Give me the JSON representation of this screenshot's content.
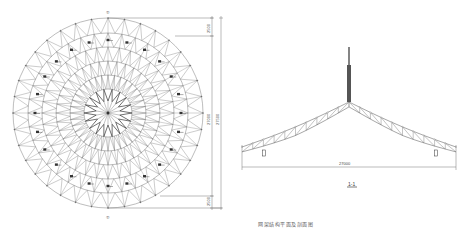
{
  "plan_view": {
    "axis_top_label": "①",
    "axis_bottom_label": "①",
    "dim_top": "2500",
    "dim_total_1": "27000",
    "dim_total_2": "27500",
    "dim_bottom": "2500",
    "ring_count": 6,
    "radial_divisions": 36
  },
  "section_view": {
    "span_dim": "27000",
    "section_title": "1-1"
  },
  "caption": "网架结构平面及剖面图",
  "colors": {
    "line": "#6b6b6b",
    "dark_line": "#333333",
    "background": "#ffffff"
  }
}
